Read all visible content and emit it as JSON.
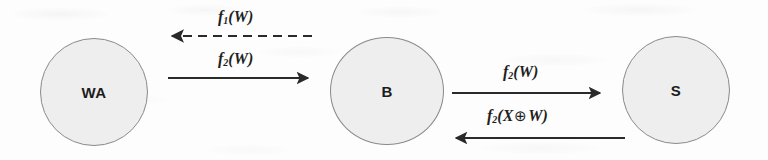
{
  "diagram": {
    "type": "protocol-flow",
    "nodes": [
      {
        "id": "WA",
        "label": "WA",
        "cx": 94,
        "cy": 92,
        "r": 54
      },
      {
        "id": "B",
        "label": "B",
        "cx": 387,
        "cy": 91,
        "r": 57
      },
      {
        "id": "S",
        "label": "S",
        "cx": 676,
        "cy": 90,
        "r": 54
      }
    ],
    "edges": [
      {
        "id": "e1",
        "from": "B",
        "to": "WA",
        "direction": "left",
        "style": "dashed",
        "label_prefix": "f",
        "label_sub": "1",
        "label_suffix": "(W)",
        "label_text": "f1(W)"
      },
      {
        "id": "e2",
        "from": "WA",
        "to": "B",
        "direction": "right",
        "style": "solid",
        "label_prefix": "f",
        "label_sub": "2",
        "label_suffix": "(W)",
        "label_text": "f2(W)"
      },
      {
        "id": "e3",
        "from": "B",
        "to": "S",
        "direction": "right",
        "style": "solid",
        "label_prefix": "f",
        "label_sub": "2",
        "label_suffix": "(W)",
        "label_text": "f2(W)"
      },
      {
        "id": "e4",
        "from": "S",
        "to": "B",
        "direction": "left",
        "style": "solid",
        "label_prefix": "f",
        "label_sub": "2",
        "label_open": "(X",
        "label_xor": "⊕",
        "label_close": "W)",
        "label_text": "f2(X⊕W)"
      }
    ],
    "colors": {
      "node_fill": "#eeeeee",
      "node_stroke": "#8a8a8a",
      "text": "#1f1f1f",
      "edge_stroke": "#2a2a2a",
      "background": "#fdfdfd"
    }
  }
}
